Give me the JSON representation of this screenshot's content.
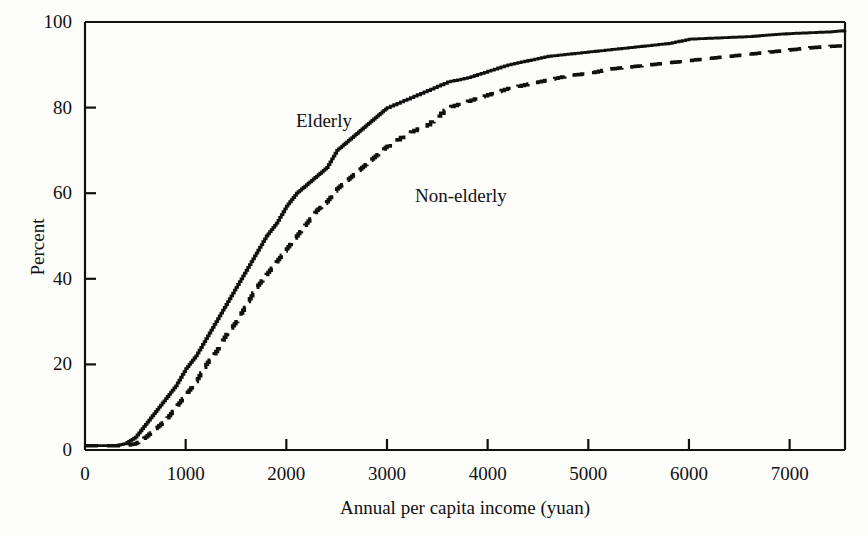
{
  "figure": {
    "cut_off_header_text": "",
    "background_color": "#fdfdfb",
    "ink_color": "#111111"
  },
  "axes": {
    "ylabel": "Percent",
    "xlabel": "Annual per capita income (yuan)",
    "yticks": [
      "0",
      "20",
      "40",
      "60",
      "80",
      "100"
    ],
    "xticks": [
      "0",
      "1000",
      "2000",
      "3000",
      "4000",
      "5000",
      "6000",
      "7000"
    ]
  },
  "annotations": {
    "elderly": "Elderly",
    "non_elderly": "Non-elderly"
  },
  "chart_data": {
    "type": "line",
    "title": "",
    "subtitle": "",
    "xlabel": "Annual per capita income (yuan)",
    "ylabel": "Percent",
    "xlim": [
      0,
      7550
    ],
    "ylim": [
      0,
      100
    ],
    "grid": false,
    "legend_position": "inline-annotation",
    "xticks": [
      0,
      1000,
      2000,
      3000,
      4000,
      5000,
      6000,
      7000
    ],
    "yticks": [
      0,
      20,
      40,
      60,
      80,
      100
    ],
    "annotations": [
      {
        "text": "Elderly",
        "x": 2100,
        "y": 83
      },
      {
        "text": "Non-elderly",
        "x": 3300,
        "y": 66
      }
    ],
    "series": [
      {
        "name": "Elderly",
        "style": "solid",
        "color": "#111111",
        "x": [
          0,
          100,
          200,
          300,
          400,
          500,
          600,
          700,
          800,
          900,
          1000,
          1100,
          1200,
          1300,
          1400,
          1500,
          1600,
          1700,
          1800,
          1900,
          2000,
          2100,
          2200,
          2300,
          2400,
          2500,
          2600,
          2700,
          2800,
          2900,
          3000,
          3200,
          3400,
          3600,
          3800,
          4000,
          4200,
          4400,
          4600,
          4800,
          5000,
          5200,
          5400,
          5600,
          5800,
          6000,
          6200,
          6400,
          6600,
          6800,
          7000,
          7200,
          7400,
          7550
        ],
        "y": [
          1,
          1,
          1,
          1,
          1.5,
          3,
          6,
          9,
          12,
          15,
          19,
          22,
          26,
          30,
          34,
          38,
          42,
          46,
          50,
          53,
          57,
          60,
          62,
          64,
          66,
          70,
          72,
          74,
          76,
          78,
          80,
          82,
          84,
          86,
          87,
          88.5,
          90,
          91,
          92,
          92.5,
          93,
          93.5,
          94,
          94.5,
          95,
          96,
          96.2,
          96.4,
          96.6,
          97,
          97.3,
          97.5,
          97.7,
          98
        ]
      },
      {
        "name": "Non-elderly",
        "style": "dashed",
        "color": "#111111",
        "x": [
          0,
          100,
          200,
          300,
          400,
          500,
          600,
          700,
          800,
          900,
          1000,
          1100,
          1200,
          1300,
          1400,
          1500,
          1600,
          1700,
          1800,
          1900,
          2000,
          2100,
          2200,
          2300,
          2400,
          2500,
          2600,
          2700,
          2800,
          2900,
          3000,
          3200,
          3400,
          3600,
          3800,
          4000,
          4200,
          4400,
          4600,
          4800,
          5000,
          5200,
          5400,
          5600,
          5800,
          6000,
          6200,
          6400,
          6600,
          6800,
          7000,
          7200,
          7400,
          7550
        ],
        "y": [
          1,
          1,
          1,
          1,
          1,
          1.5,
          3,
          5,
          7,
          10,
          13,
          16,
          20,
          23,
          27,
          30,
          34,
          38,
          41,
          44,
          47,
          50,
          53,
          56,
          58,
          61,
          63,
          65,
          67,
          69,
          71,
          74,
          76,
          80,
          81.5,
          83,
          84.5,
          85.5,
          86.5,
          87.5,
          88,
          89,
          89.5,
          90,
          90.5,
          91,
          91.5,
          92,
          92.5,
          93,
          93.5,
          94,
          94.3,
          94.5
        ]
      }
    ]
  }
}
